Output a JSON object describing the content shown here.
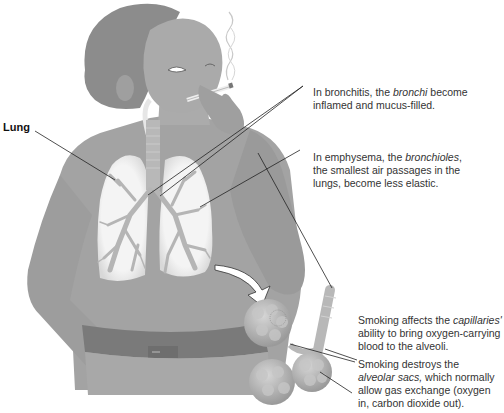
{
  "diagram": {
    "labels": {
      "lung": "Lung",
      "bronchitis": {
        "pre": "In bronchitis, the ",
        "term": "bronchi",
        "post": " become inflamed and mucus-filled."
      },
      "emphysema": {
        "pre": "In emphysema, the ",
        "term": "bronchioles",
        "post": ", the smallest air passages in the lungs, become less elastic."
      },
      "capillaries": {
        "pre": "Smoking affects the ",
        "term": "capillaries'",
        "post": " ability to bring oxygen-carrying blood to the alveoli."
      },
      "alveolar": {
        "pre": "Smoking destroys the ",
        "term": "alveolar sacs,",
        "post": " which normally allow gas exchange (oxygen in, carbon dioxide out)."
      }
    },
    "colors": {
      "skin": "#a8a8a8",
      "hair": "#8c8c8c",
      "shirt": "#a3a3a3",
      "lung_fill": "#f2f2f2",
      "bronchi": "#b5b5b5",
      "belt": "#7a7a7a",
      "alveoli": "#b0b0b0",
      "text": "#333333",
      "leader_line": "#222222"
    }
  }
}
